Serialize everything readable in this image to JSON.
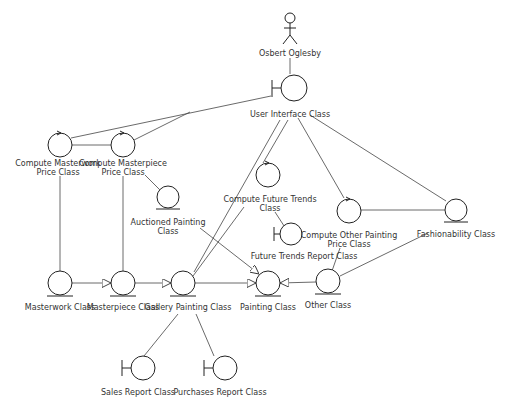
{
  "diagram": {
    "type": "UML analysis class diagram (robustness)",
    "actor": {
      "label": "Osbert Oglesby"
    },
    "classes": {
      "user_interface": {
        "label": "User  Interface  Class",
        "stereotype": "boundary"
      },
      "compute_masterwork": {
        "line1": "Compute Masterwork",
        "line2": "Price  Class",
        "stereotype": "control"
      },
      "compute_masterpiece": {
        "line1": "Compute Masterpiece",
        "line2": "Price  Class",
        "stereotype": "control"
      },
      "auctioned_painting": {
        "line1": "Auctioned Painting",
        "line2": "Class",
        "stereotype": "entity"
      },
      "compute_future_trends": {
        "line1": "Compute Future Trends",
        "line2": "Class",
        "stereotype": "control"
      },
      "future_trends_report": {
        "label": "Future Trends Report Class",
        "stereotype": "boundary"
      },
      "compute_other_painting": {
        "line1": "Compute Other Painting",
        "line2": "Price  Class",
        "stereotype": "control"
      },
      "fashionability": {
        "label": "Fashionability  Class",
        "stereotype": "entity"
      },
      "masterwork": {
        "label": "Masterwork Class",
        "stereotype": "entity"
      },
      "masterpiece": {
        "label": "Masterpiece Class",
        "stereotype": "entity"
      },
      "gallery_painting": {
        "label": "Gallery  Painting Class",
        "stereotype": "entity"
      },
      "painting": {
        "label": "Painting Class",
        "stereotype": "entity"
      },
      "other": {
        "label": "Other Class",
        "stereotype": "entity"
      },
      "sales_report": {
        "label": "Sales  Report Class",
        "stereotype": "boundary"
      },
      "purchases_report": {
        "label": "Purchases  Report Class",
        "stereotype": "boundary"
      }
    },
    "relationships": [
      {
        "from": "Osbert Oglesby",
        "to": "User Interface Class",
        "type": "association"
      },
      {
        "from": "User Interface Class",
        "to": "Compute Masterwork Price Class",
        "type": "association"
      },
      {
        "from": "User Interface Class",
        "to": "Compute Masterpiece Price Class",
        "type": "association"
      },
      {
        "from": "User Interface Class",
        "to": "Gallery Painting Class",
        "type": "association"
      },
      {
        "from": "User Interface Class",
        "to": "Compute Future Trends Class",
        "type": "association"
      },
      {
        "from": "User Interface Class",
        "to": "Compute Other Painting Price Class",
        "type": "association"
      },
      {
        "from": "User Interface Class",
        "to": "Fashionability Class",
        "type": "association"
      },
      {
        "from": "Compute Masterwork Price Class",
        "to": "Compute Masterpiece Price Class",
        "type": "association"
      },
      {
        "from": "Compute Masterwork Price Class",
        "to": "Masterwork Class",
        "type": "association"
      },
      {
        "from": "Compute Masterpiece Price Class",
        "to": "Masterpiece Class",
        "type": "association"
      },
      {
        "from": "Compute Masterpiece Price Class",
        "to": "Auctioned Painting Class",
        "type": "association"
      },
      {
        "from": "Compute Future Trends Class",
        "to": "Future Trends Report Class",
        "type": "association"
      },
      {
        "from": "Compute Future Trends Class",
        "to": "Gallery Painting Class",
        "type": "association"
      },
      {
        "from": "Compute Other Painting Price Class",
        "to": "Fashionability Class",
        "type": "association"
      },
      {
        "from": "Compute Other Painting Price Class",
        "to": "Other Class",
        "type": "association"
      },
      {
        "from": "Fashionability Class",
        "to": "Other Class",
        "type": "association"
      },
      {
        "from": "Masterwork Class",
        "to": "Masterpiece Class",
        "type": "generalization"
      },
      {
        "from": "Masterpiece Class",
        "to": "Gallery Painting Class",
        "type": "generalization"
      },
      {
        "from": "Gallery Painting Class",
        "to": "Painting Class",
        "type": "generalization"
      },
      {
        "from": "Other Class",
        "to": "Painting Class",
        "type": "generalization"
      },
      {
        "from": "Auctioned Painting Class",
        "to": "Painting Class",
        "type": "generalization"
      },
      {
        "from": "Gallery Painting Class",
        "to": "Sales Report Class",
        "type": "association"
      },
      {
        "from": "Gallery Painting Class",
        "to": "Purchases Report Class",
        "type": "association"
      }
    ],
    "colors": {
      "line": "#333333",
      "background": "#ffffff",
      "text": "#333333"
    }
  }
}
